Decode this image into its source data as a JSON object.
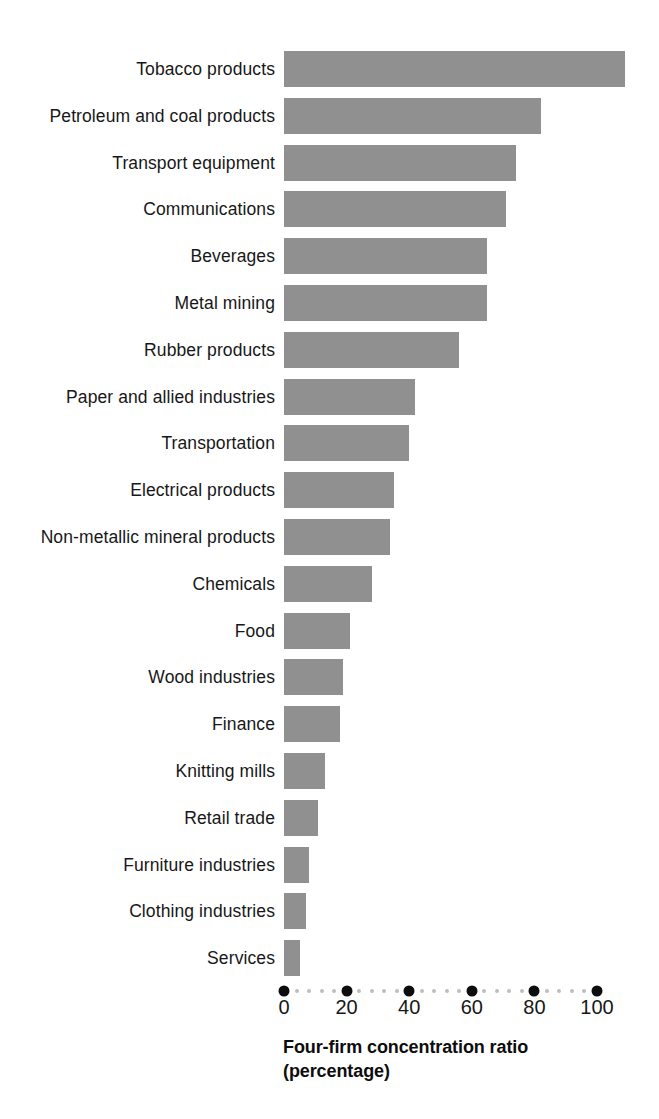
{
  "chart_data": {
    "type": "bar",
    "orientation": "horizontal",
    "title": "",
    "xlabel": "Four-firm concentration ratio (percentage)",
    "ylabel": "",
    "xlim": [
      0,
      110
    ],
    "grid": false,
    "legend": null,
    "bar_color": "#909090",
    "tick_color": "#0d0d0d",
    "minor_tick_color": "#bdbdbd",
    "categories": [
      "Tobacco products",
      "Petroleum and coal products",
      "Transport equipment",
      "Communications",
      "Beverages",
      "Metal mining",
      "Rubber products",
      "Paper and allied industries",
      "Transportation",
      "Electrical products",
      "Non-metallic mineral products",
      "Chemicals",
      "Food",
      "Wood industries",
      "Finance",
      "Knitting mills",
      "Retail trade",
      "Furniture industries",
      "Clothing industries",
      "Services"
    ],
    "values": [
      109,
      82,
      74,
      71,
      65,
      65,
      56,
      42,
      40,
      35,
      34,
      28,
      21,
      19,
      18,
      13,
      11,
      8,
      7,
      5
    ],
    "xticks": [
      0,
      20,
      40,
      60,
      80,
      100
    ],
    "xticklabels": [
      "0",
      "20",
      "40",
      "60",
      "80",
      "100"
    ],
    "minor_tick_step": 4
  },
  "axis_title": {
    "line1": "Four-firm concentration ratio",
    "line2": "(percentage)"
  }
}
